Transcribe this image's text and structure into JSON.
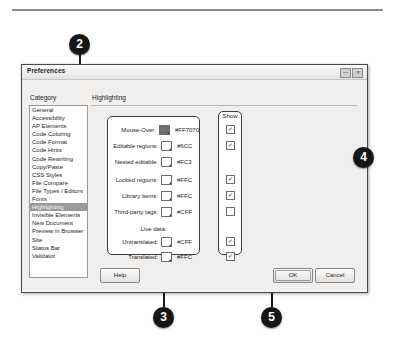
{
  "dialog": {
    "title": "Preferences",
    "window_controls": [
      "—",
      "✕"
    ],
    "category_header": "Category",
    "panel_header": "Highlighting",
    "categories": [
      "General",
      "Accessibility",
      "AP Elements",
      "Code Coloring",
      "Code Format",
      "Code Hints",
      "Code Rewriting",
      "Copy/Paste",
      "CSS Styles",
      "File Compare",
      "File Types / Editors",
      "Fonts",
      "Highlighting",
      "Invisible Elements",
      "New Document",
      "Preview in Browser",
      "Site",
      "Status Bar",
      "Validator"
    ],
    "selected_category": "Highlighting",
    "show_column_header": "Show",
    "live_data_label": "Live data:",
    "fields": [
      {
        "label": "Mouse-Over:",
        "hex": "#FF7070",
        "swatch_color": "#FF7070",
        "swatch_filled": true,
        "show_checked": true,
        "has_checkbox": true
      },
      {
        "label": "Editable regions:",
        "hex": "#6CC",
        "swatch_color": "#66CCCC",
        "swatch_filled": false,
        "show_checked": true,
        "has_checkbox": true
      },
      {
        "label": "Nested editable:",
        "hex": "#FC3",
        "swatch_color": "#FFCC33",
        "swatch_filled": false,
        "show_checked": false,
        "has_checkbox": false
      },
      {
        "label": "Locked regions:",
        "hex": "#FFC",
        "swatch_color": "#FFFFCC",
        "swatch_filled": false,
        "show_checked": true,
        "has_checkbox": true
      },
      {
        "label": "Library items:",
        "hex": "#FFC",
        "swatch_color": "#FFFFCC",
        "swatch_filled": false,
        "show_checked": true,
        "has_checkbox": true
      },
      {
        "label": "Third-party tags:",
        "hex": "#CFF",
        "swatch_color": "#CCFFFF",
        "swatch_filled": false,
        "show_checked": false,
        "has_checkbox": true
      },
      {
        "label": "Untranslated:",
        "hex": "#CFF",
        "swatch_color": "#CCFFFF",
        "swatch_filled": false,
        "show_checked": true,
        "has_checkbox": true
      },
      {
        "label": "Translated:",
        "hex": "#FFC",
        "swatch_color": "#FFFFCC",
        "swatch_filled": false,
        "show_checked": true,
        "has_checkbox": true
      }
    ],
    "buttons": {
      "help": "Help",
      "ok": "OK",
      "cancel": "Cancel"
    }
  },
  "callouts": [
    {
      "number": "2"
    },
    {
      "number": "3"
    },
    {
      "number": "4"
    },
    {
      "number": "5"
    }
  ],
  "checkmark_glyph": "✓"
}
